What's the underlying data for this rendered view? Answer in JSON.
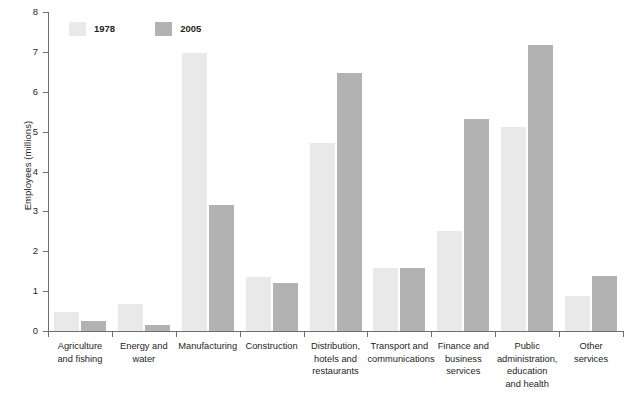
{
  "chart_data": {
    "type": "bar",
    "title": "",
    "xlabel": "",
    "ylabel": "Employees (millions)",
    "ylim": [
      0,
      8
    ],
    "ytick_labels": [
      "0",
      "1",
      "2",
      "3",
      "4",
      "5",
      "6",
      "7",
      "8"
    ],
    "ytick_values": [
      0,
      1,
      2,
      3,
      4,
      5,
      6,
      7,
      8
    ],
    "grid": false,
    "legend_position": "top-left",
    "categories": [
      "Agriculture and fishing",
      "Energy and water",
      "Manufacturing",
      "Construction",
      "Distribution, hotels and restaurants",
      "Transport and communications",
      "Finance and business services",
      "Public administration, education and health",
      "Other services"
    ],
    "category_lines": [
      [
        "Agriculture",
        "and fishing"
      ],
      [
        "Energy and",
        "water"
      ],
      [
        "Manufacturing"
      ],
      [
        "Construction"
      ],
      [
        "Distribution,",
        "hotels and",
        "restaurants"
      ],
      [
        "Transport and",
        "communications"
      ],
      [
        "Finance and",
        "business",
        "services"
      ],
      [
        "Public",
        "administration,",
        "education",
        "and health"
      ],
      [
        "Other",
        "services"
      ]
    ],
    "series": [
      {
        "name": "1978",
        "color": "#e9e9e9",
        "values": [
          0.48,
          0.68,
          6.97,
          1.35,
          4.71,
          1.57,
          2.51,
          5.11,
          0.88
        ]
      },
      {
        "name": "2005",
        "color": "#b2b2b2",
        "values": [
          0.25,
          0.15,
          3.16,
          1.2,
          6.47,
          1.57,
          5.31,
          7.17,
          1.38
        ]
      }
    ]
  },
  "legend": {
    "entries": [
      {
        "label": "1978",
        "color": "#e9e9e9"
      },
      {
        "label": "2005",
        "color": "#b2b2b2"
      }
    ]
  },
  "axes": {
    "y_title": "Employees (millions)",
    "axis_color": "#6d6e71"
  }
}
